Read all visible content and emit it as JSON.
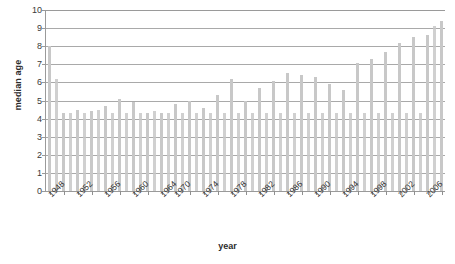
{
  "chart_data": {
    "type": "bar",
    "title": "",
    "xlabel": "year",
    "ylabel": "median age",
    "ylim": [
      0,
      10
    ],
    "ytick_labels": [
      "0",
      "1",
      "2",
      "3",
      "4",
      "5",
      "6",
      "7",
      "8",
      "9",
      "10"
    ],
    "grid": true,
    "legend": "none",
    "bar_color": "#c8c8c8",
    "axis_color": "#9a9a9a",
    "xtick_label_interval": 2,
    "categories": [
      "1948",
      "1949",
      "1950",
      "1951",
      "1952",
      "1953",
      "1954",
      "1955",
      "1956",
      "1957",
      "1958",
      "1959",
      "1960",
      "1961",
      "1962",
      "1963",
      "1964",
      "1965",
      "1970",
      "1971",
      "1972",
      "1973",
      "1974",
      "1975",
      "1976",
      "1977",
      "1978",
      "1979",
      "1980",
      "1981",
      "1982",
      "1983",
      "1984",
      "1985",
      "1986",
      "1987",
      "1988",
      "1989",
      "1990",
      "1991",
      "1992",
      "1993",
      "1994",
      "1995",
      "1996",
      "1997",
      "1998",
      "1999",
      "2000",
      "2001",
      "2002",
      "2003",
      "2004",
      "2005",
      "2006",
      "2007",
      "2008"
    ],
    "values": [
      8.0,
      6.2,
      4.3,
      4.3,
      4.5,
      4.3,
      4.4,
      4.5,
      4.7,
      4.3,
      5.1,
      4.3,
      4.9,
      4.3,
      4.3,
      4.4,
      4.3,
      4.3,
      4.8,
      4.3,
      5.0,
      4.3,
      4.6,
      4.3,
      5.3,
      4.3,
      6.2,
      4.3,
      5.0,
      4.3,
      5.7,
      4.3,
      6.1,
      4.3,
      6.5,
      4.3,
      6.4,
      4.3,
      6.3,
      4.3,
      5.9,
      4.3,
      5.6,
      4.3,
      7.1,
      4.3,
      7.3,
      4.3,
      7.7,
      4.3,
      8.2,
      4.3,
      8.5,
      4.3,
      8.6,
      9.1,
      9.4
    ],
    "xtick_labels_shown": [
      "1948",
      "1952",
      "1956",
      "1960",
      "1964",
      "1970",
      "1974",
      "1978",
      "1982",
      "1986",
      "1990",
      "1994",
      "1998",
      "2002",
      "2006"
    ]
  }
}
